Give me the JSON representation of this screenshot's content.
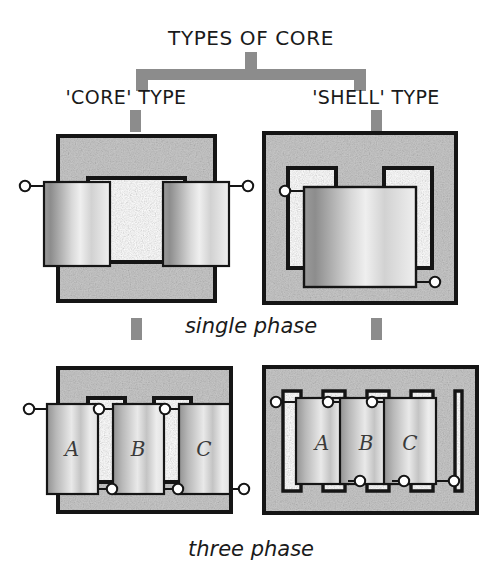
{
  "title": "TYPES OF CORE",
  "branches": [
    {
      "id": "core",
      "label": "'CORE' TYPE"
    },
    {
      "id": "shell",
      "label": "'SHELL' TYPE"
    }
  ],
  "rows": [
    {
      "id": "single",
      "caption": "single phase"
    },
    {
      "id": "three",
      "caption": "three phase"
    }
  ],
  "limb_labels": [
    "A",
    "B",
    "C"
  ],
  "diagrams": {
    "core_single": {
      "name": "core-type-single-phase",
      "limbs": 2,
      "windings": 2,
      "terminals": 2
    },
    "shell_single": {
      "name": "shell-type-single-phase",
      "limbs": 3,
      "windings": 1,
      "terminals": 2
    },
    "core_three": {
      "name": "core-type-three-phase",
      "limbs": 3,
      "windings": 3,
      "terminals": 6,
      "labels": [
        "A",
        "B",
        "C"
      ]
    },
    "shell_three": {
      "name": "shell-type-three-phase",
      "limbs": 3,
      "windings": 3,
      "terminals": 6,
      "labels": [
        "A",
        "B",
        "C"
      ]
    }
  },
  "colors": {
    "connector_gray": "#8c8c8c",
    "core_fill": "#c9c9c9",
    "outline": "#151515",
    "winding_dark": "#8f8f8f",
    "winding_light": "#f2f2f2",
    "text": "#1a1a1a",
    "background": "#ffffff"
  }
}
